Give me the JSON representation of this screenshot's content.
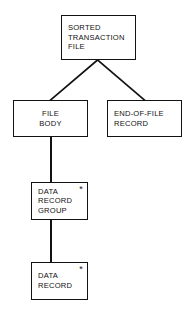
{
  "diagram": {
    "type": "hierarchical-data-structure-chart",
    "background_color": "#ffffff",
    "line_color": "#121212",
    "text_color": "#111111",
    "repeat_symbol": "*",
    "nodes": [
      {
        "id": "sorted-transaction-file",
        "label": "SORTED\nTRANSACTION\nFILE",
        "align": "left",
        "repeat": false,
        "level": 0
      },
      {
        "id": "file-body",
        "label": "FILE\nBODY",
        "align": "center",
        "repeat": false,
        "level": 1
      },
      {
        "id": "end-of-file-record",
        "label": "END-OF-FILE\nRECORD",
        "align": "left",
        "repeat": false,
        "level": 1
      },
      {
        "id": "data-record-group",
        "label": "DATA\nRECORD\nGROUP",
        "align": "left",
        "repeat": true,
        "level": 2
      },
      {
        "id": "data-record",
        "label": "DATA\nRECORD",
        "align": "left",
        "repeat": true,
        "level": 3
      }
    ],
    "connections": [
      {
        "id": "conn-root-to-file-body",
        "from": "sorted-transaction-file",
        "to": "file-body",
        "style": "diagonal"
      },
      {
        "id": "conn-root-to-eof-record",
        "from": "sorted-transaction-file",
        "to": "end-of-file-record",
        "style": "diagonal"
      },
      {
        "id": "conn-body-to-group",
        "from": "file-body",
        "to": "data-record-group",
        "style": "vertical"
      },
      {
        "id": "conn-group-to-record",
        "from": "data-record-group",
        "to": "data-record",
        "style": "vertical"
      }
    ]
  }
}
